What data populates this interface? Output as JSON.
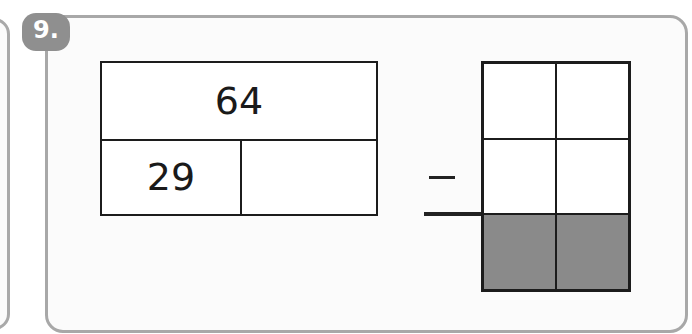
{
  "question": {
    "number_label": "9."
  },
  "bar_model": {
    "whole": "64",
    "parts": [
      "29",
      ""
    ]
  },
  "column_subtraction": {
    "operator": "−",
    "rows": [
      {
        "tens": "",
        "ones": "",
        "shaded": false
      },
      {
        "tens": "",
        "ones": "",
        "shaded": false
      },
      {
        "tens": "",
        "ones": "",
        "shaded": true
      }
    ]
  },
  "colors": {
    "panel_border": "#a8a8a8",
    "badge_fill": "#8f8f8f",
    "answer_shade": "#8a8a8a",
    "line": "#1c1c1c"
  }
}
